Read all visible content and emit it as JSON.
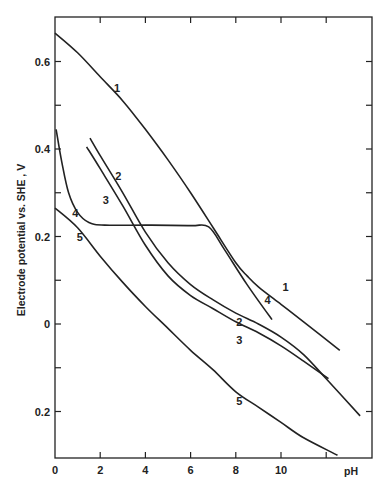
{
  "chart_data": {
    "type": "line",
    "title": "",
    "xlabel": "pH",
    "ylabel": "Electrode potential vs. SHE , V",
    "xlim": [
      0,
      13.5
    ],
    "ylim": [
      -0.3,
      0.7
    ],
    "grid": false,
    "legend": "inline numeric labels on curves",
    "x_ticks": [
      {
        "value": 0,
        "label": "0"
      },
      {
        "value": 2,
        "label": "2"
      },
      {
        "value": 4,
        "label": "4"
      },
      {
        "value": 6,
        "label": "6"
      },
      {
        "value": 8,
        "label": "8"
      },
      {
        "value": 10,
        "label": "10"
      }
    ],
    "y_ticks": [
      {
        "value": 0.6,
        "label": "0.6"
      },
      {
        "value": 0.4,
        "label": "0.4"
      },
      {
        "value": 0.2,
        "label": "0.2"
      },
      {
        "value": 0.0,
        "label": "0"
      },
      {
        "value": -0.2,
        "label": "0.2"
      }
    ],
    "series": [
      {
        "name": "1",
        "points": [
          [
            0,
            0.665
          ],
          [
            1,
            0.62
          ],
          [
            2,
            0.565
          ],
          [
            3,
            0.51
          ],
          [
            4,
            0.445
          ],
          [
            5,
            0.375
          ],
          [
            6,
            0.3
          ],
          [
            7,
            0.22
          ],
          [
            8,
            0.14
          ],
          [
            8.5,
            0.11
          ],
          [
            9,
            0.085
          ],
          [
            10,
            0.045
          ],
          [
            11,
            0.005
          ],
          [
            12.6,
            -0.06
          ]
        ],
        "label_at": [
          2.75,
          0.53
        ]
      },
      {
        "name": "2",
        "points": [
          [
            1.55,
            0.425
          ],
          [
            2,
            0.385
          ],
          [
            3,
            0.3
          ],
          [
            4,
            0.21
          ],
          [
            5,
            0.14
          ],
          [
            6,
            0.09
          ],
          [
            7,
            0.055
          ],
          [
            8,
            0.025
          ],
          [
            9,
            0.0
          ],
          [
            10,
            -0.03
          ],
          [
            11,
            -0.07
          ],
          [
            12,
            -0.125
          ],
          [
            13.5,
            -0.21
          ]
        ],
        "label_at": [
          2.8,
          0.33
        ]
      },
      {
        "name": "3",
        "points": [
          [
            1.4,
            0.405
          ],
          [
            2,
            0.355
          ],
          [
            3,
            0.27
          ],
          [
            4,
            0.18
          ],
          [
            5,
            0.11
          ],
          [
            6,
            0.065
          ],
          [
            7,
            0.035
          ],
          [
            8,
            0.005
          ],
          [
            9,
            -0.02
          ],
          [
            10,
            -0.05
          ],
          [
            11,
            -0.085
          ],
          [
            12.1,
            -0.125
          ]
        ],
        "label_at": [
          2.25,
          0.275
        ]
      },
      {
        "name": "4",
        "points": [
          [
            0.05,
            0.445
          ],
          [
            0.3,
            0.37
          ],
          [
            0.6,
            0.3
          ],
          [
            1,
            0.255
          ],
          [
            1.5,
            0.232
          ],
          [
            2.2,
            0.226
          ],
          [
            4,
            0.226
          ],
          [
            6,
            0.225
          ],
          [
            6.8,
            0.222
          ],
          [
            7.5,
            0.17
          ],
          [
            8.5,
            0.09
          ],
          [
            9.6,
            0.01
          ]
        ],
        "label_at": [
          0.9,
          0.245
        ]
      },
      {
        "name": "5",
        "points": [
          [
            0,
            0.265
          ],
          [
            1,
            0.22
          ],
          [
            2,
            0.155
          ],
          [
            3,
            0.095
          ],
          [
            4,
            0.04
          ],
          [
            5,
            -0.01
          ],
          [
            6,
            -0.06
          ],
          [
            7,
            -0.105
          ],
          [
            8,
            -0.155
          ],
          [
            9,
            -0.19
          ],
          [
            10,
            -0.225
          ],
          [
            11,
            -0.26
          ],
          [
            12.5,
            -0.3
          ]
        ],
        "label_at": [
          1.1,
          0.19
        ]
      }
    ]
  },
  "axes": {
    "x_title": "pH",
    "y_title": "Electrode potential vs. SHE , V"
  },
  "colors": {
    "ink": "#222222",
    "background": "#ffffff"
  }
}
